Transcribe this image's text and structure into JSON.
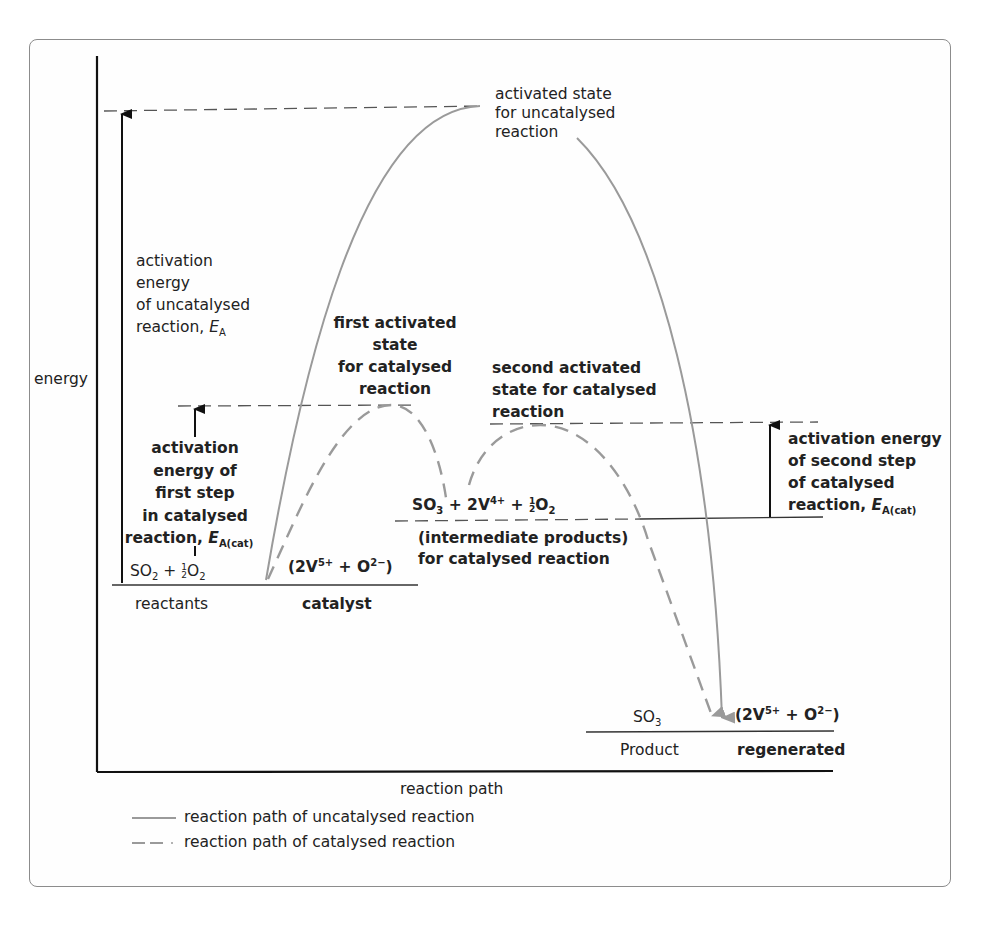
{
  "diagram": {
    "axes": {
      "y_label": "energy",
      "x_label": "reaction path"
    },
    "levels": {
      "reactants": {
        "formula": "SO2 + ½O2",
        "formula_parts": {
          "a": "SO",
          "a_sub": "2",
          "plus": " + ",
          "b": "O",
          "b_sub": "2"
        },
        "label": "reactants",
        "catalyst_formula": "(2V5+ + O2−)",
        "catalyst_parts": {
          "open": "(2V",
          "v_sup": "5+",
          "mid": " + O",
          "o_sup": "2−",
          "close": ")"
        },
        "catalyst_label": "catalyst"
      },
      "intermediate": {
        "formula": "SO3 + 2V4+ + ½O2",
        "formula_parts": {
          "a": "SO",
          "a_sub": "3",
          "mid": " + 2V",
          "v_sup": "4+",
          "plus": " + ",
          "b": "O",
          "b_sub": "2"
        },
        "label_line1": "(intermediate products)",
        "label_line2": "for catalysed reaction"
      },
      "products": {
        "formula": "SO3",
        "formula_parts": {
          "a": "SO",
          "a_sub": "3"
        },
        "label": "Product",
        "catalyst_formula": "(2V5+ + O2−)",
        "catalyst_parts": {
          "open": "(2V",
          "v_sup": "5+",
          "mid": " + O",
          "o_sup": "2−",
          "close": ")"
        },
        "catalyst_label": "regenerated"
      }
    },
    "annotations": {
      "uncat_peak": [
        "activated state",
        "for uncatalysed",
        "reaction"
      ],
      "ea_uncat": [
        "activation",
        "energy",
        "of uncatalysed",
        "reaction, "
      ],
      "ea_symbol": "E",
      "ea_sub": "A",
      "first_peak": [
        "first activated",
        "state",
        "for catalysed",
        "reaction"
      ],
      "ea_first": [
        "activation",
        "energy of",
        "first step",
        "in catalysed",
        "reaction, "
      ],
      "ea_cat_sub": "A(cat)",
      "second_peak": [
        "second activated",
        "state for catalysed",
        "reaction"
      ],
      "ea_second": [
        "activation energy",
        "of second step",
        "of catalysed",
        "reaction, "
      ]
    },
    "legend": [
      {
        "style": "solid",
        "label": "reaction path of uncatalysed reaction"
      },
      {
        "style": "dashed",
        "label": "reaction path of catalysed reaction"
      }
    ],
    "colors": {
      "axis": "#111111",
      "curve": "#9a9a9a",
      "guide": "#555555",
      "frame": "#8c8c8c"
    }
  }
}
